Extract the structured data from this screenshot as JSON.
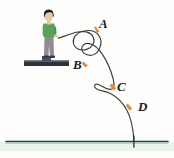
{
  "figure": {
    "background_color": "#fdfdfc",
    "curve_color": "#3c3c3c",
    "marker_color": "#ef8434",
    "ground_color": "#27403a",
    "ground_tint_color": "#dff0e6",
    "platform_color": "#2e3340",
    "platform_top_color": "#6b7280"
  },
  "person": {
    "name": "standing-person",
    "hair_color": "#1a1a1a",
    "skin_color": "#e8c9a8",
    "shirt_color": "#5aa45a",
    "pants_color": "#8d8d93",
    "shoe_color": "#3a3a40"
  },
  "labels": {
    "a": "A",
    "b": "B",
    "c": "C",
    "d": "D"
  },
  "markers": [
    {
      "label": "A",
      "x": 97,
      "y": 29
    },
    {
      "label": "B",
      "x": 85,
      "y": 64
    },
    {
      "label": "C",
      "x": 114,
      "y": 88
    },
    {
      "label": "D",
      "x": 130,
      "y": 108
    }
  ],
  "ground": {
    "label": "ground-line",
    "y": 141,
    "x_start": 6,
    "x_end": 168
  },
  "platform": {
    "label": "platform",
    "x": 24,
    "y": 61,
    "width": 45,
    "height": 6
  },
  "impact": {
    "label": "impact-point",
    "x": 134,
    "y": 141
  }
}
